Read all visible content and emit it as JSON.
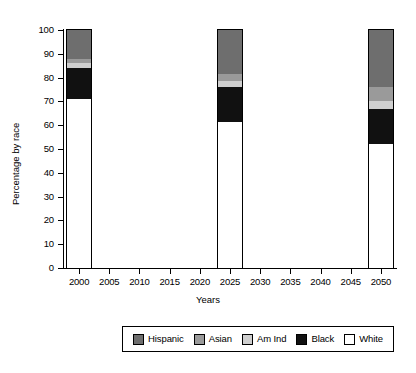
{
  "chart_data": {
    "type": "bar",
    "subtype": "stacked-vertical-percentage",
    "title": "",
    "xlabel": "Years",
    "ylabel": "Percentage by race",
    "categories": [
      "2000",
      "2025",
      "2050"
    ],
    "bar_positions": [
      2000,
      2025,
      2050
    ],
    "xlim": [
      1997.5,
      2052.5
    ],
    "ylim": [
      0,
      100
    ],
    "xticks": [
      "2000",
      "2005",
      "2010",
      "2015",
      "2020",
      "2025",
      "2030",
      "2035",
      "2040",
      "2045",
      "2050"
    ],
    "yticks": [
      "0",
      "10",
      "20",
      "30",
      "40",
      "50",
      "60",
      "70",
      "80",
      "90",
      "100"
    ],
    "grid": false,
    "legend_position": "bottom-outside",
    "stack_order_bottom_to_top": [
      "White",
      "Black",
      "Am Ind",
      "Asian",
      "Hispanic"
    ],
    "series": [
      {
        "name": "Hispanic",
        "color": "#6e6e6e",
        "values": [
          12.0,
          18.5,
          24.0
        ]
      },
      {
        "name": "Asian",
        "color": "#9a9a9a",
        "values": [
          2.0,
          3.0,
          6.0
        ]
      },
      {
        "name": "Am Ind",
        "color": "#cfcfcf",
        "values": [
          2.0,
          2.5,
          3.0
        ]
      },
      {
        "name": "Black",
        "color": "#111111",
        "values": [
          13.0,
          14.5,
          15.0
        ]
      },
      {
        "name": "White",
        "color": "#ffffff",
        "values": [
          71.0,
          61.5,
          52.0
        ]
      }
    ],
    "cumulative_tops": {
      "2000": {
        "White": 71.0,
        "Black": 84.0,
        "Am Ind": 86.0,
        "Asian": 88.0,
        "Hispanic": 100.0
      },
      "2025": {
        "White": 61.5,
        "Black": 76.0,
        "Am Ind": 78.5,
        "Asian": 81.5,
        "Hispanic": 100.0
      },
      "2050": {
        "White": 52.0,
        "Black": 67.0,
        "Am Ind": 70.0,
        "Asian": 76.0,
        "Hispanic": 100.0
      }
    }
  },
  "legend": {
    "items": [
      {
        "label": "Hispanic",
        "color": "#6e6e6e"
      },
      {
        "label": "Asian",
        "color": "#9a9a9a"
      },
      {
        "label": "Am Ind",
        "color": "#cfcfcf"
      },
      {
        "label": "Black",
        "color": "#111111"
      },
      {
        "label": "White",
        "color": "#ffffff"
      }
    ]
  },
  "colors": {
    "background": "#ffffff",
    "axis": "#000000",
    "text": "#000000"
  }
}
